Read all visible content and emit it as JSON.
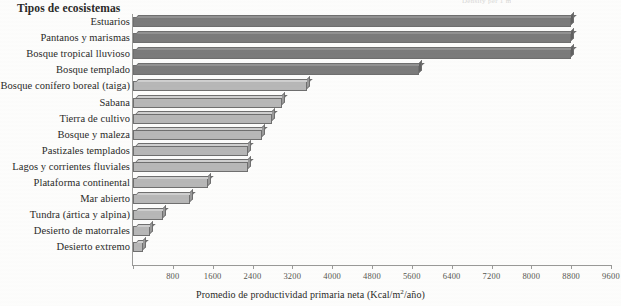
{
  "top_fragment": "Density per 1 m",
  "chart_title": "Tipos de ecosistemas",
  "x_axis_title_prefix": "Promedio de productividad primaria neta (Kcal/m",
  "x_axis_title_sup": "2",
  "x_axis_title_suffix": "/año)",
  "colors": {
    "bar_dark_front": "#7b7b7b",
    "bar_light_front": "#b7b7b7",
    "bar_outline": "#6f6f6f",
    "axis": "#9a9a98",
    "background": "#fdfdfc",
    "text": "#2a2a28"
  },
  "chart_data": {
    "type": "bar",
    "orientation": "horizontal",
    "title": "Tipos de ecosistemas",
    "xlabel": "Promedio de productividad primaria neta (Kcal/m2/año)",
    "ylabel": "Tipos de ecosistemas",
    "xlim": [
      0,
      9600
    ],
    "xticks": [
      0,
      800,
      1600,
      2400,
      3200,
      4000,
      4800,
      5600,
      6400,
      7200,
      8000,
      8800,
      9600
    ],
    "xtick_labels": [
      "",
      "800",
      "1600",
      "2400",
      "3200",
      "4000",
      "4800",
      "5600",
      "6400",
      "7200",
      "8000",
      "8800",
      "9600"
    ],
    "grid": false,
    "legend": false,
    "categories": [
      "Estuarios",
      "Pantanos y marismas",
      "Bosque tropical lluvioso",
      "Bosque templado",
      "Bosque conífero boreal (taiga)",
      "Sabana",
      "Tierra de cultivo",
      "Bosque y maleza",
      "Pastizales templados",
      "Lagos y corrientes fluviales",
      "Plataforma continental",
      "Mar abierto",
      "Tundra (ártica y alpina)",
      "Desierto de matorrales",
      "Desierto extremo"
    ],
    "values": [
      8800,
      8800,
      8800,
      5750,
      3500,
      3000,
      2800,
      2600,
      2300,
      2300,
      1500,
      1150,
      600,
      350,
      200
    ],
    "shades": [
      "dark",
      "dark",
      "dark",
      "dark",
      "light",
      "light",
      "light",
      "light",
      "light",
      "light",
      "light",
      "light",
      "light",
      "light",
      "light"
    ]
  }
}
